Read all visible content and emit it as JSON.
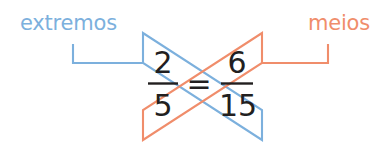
{
  "diagram": {
    "title_text": "",
    "background_color": "#ffffff",
    "labels": {
      "left": {
        "text": "extremos",
        "color": "#7cb0dd",
        "name": "extremes-label"
      },
      "right": {
        "text": "meios",
        "color": "#f08d6b",
        "name": "means-label"
      }
    },
    "proportion": {
      "left_numerator": "2",
      "left_denominator": "5",
      "right_numerator": "6",
      "right_denominator": "15",
      "equals": "=",
      "numeral_color": "#221f1f"
    },
    "connectors": {
      "extremes_color": "#7cb0dd",
      "means_color": "#f08d6b",
      "extremes_path_name": "extremes-cross-band",
      "means_path_name": "means-cross-band"
    }
  }
}
